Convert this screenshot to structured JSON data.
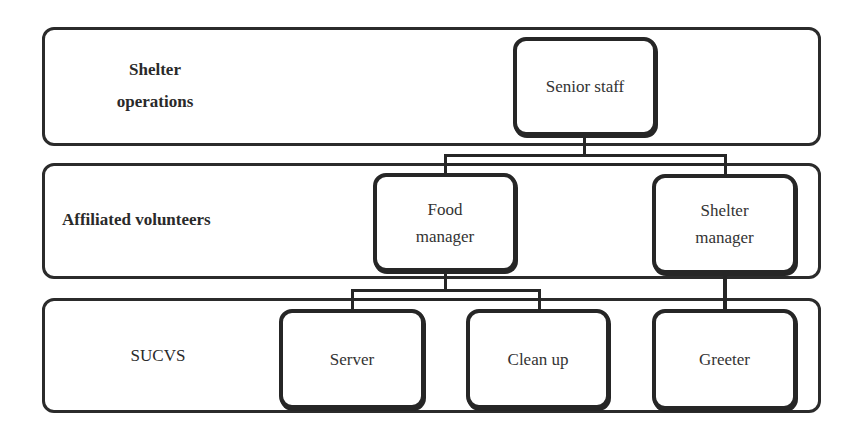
{
  "diagram": {
    "type": "org-chart",
    "bands": [
      {
        "id": "shelter-operations",
        "label": "Shelter operations"
      },
      {
        "id": "affiliated-volunteers",
        "label": "Affiliated volunteers"
      },
      {
        "id": "sucvs",
        "label": "SUCVS"
      }
    ],
    "nodes": [
      {
        "id": "senior-staff",
        "label": "Senior staff",
        "band": "shelter-operations"
      },
      {
        "id": "food-manager",
        "label": "Food manager",
        "band": "affiliated-volunteers"
      },
      {
        "id": "shelter-manager",
        "label": "Shelter manager",
        "band": "affiliated-volunteers"
      },
      {
        "id": "server",
        "label": "Server",
        "band": "sucvs"
      },
      {
        "id": "clean-up",
        "label": "Clean up",
        "band": "sucvs"
      },
      {
        "id": "greeter",
        "label": "Greeter",
        "band": "sucvs"
      }
    ],
    "edges": [
      {
        "from": "senior-staff",
        "to": "food-manager"
      },
      {
        "from": "senior-staff",
        "to": "shelter-manager"
      },
      {
        "from": "food-manager",
        "to": "server"
      },
      {
        "from": "food-manager",
        "to": "clean-up"
      },
      {
        "from": "shelter-manager",
        "to": "greeter"
      }
    ],
    "colors": {
      "stroke": "#262626",
      "background": "#ffffff",
      "text": "#2a2a2a"
    }
  }
}
